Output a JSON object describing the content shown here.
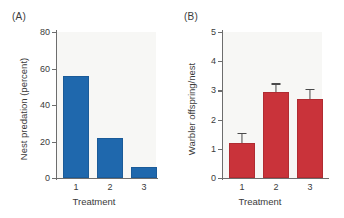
{
  "chart_data": [
    {
      "type": "bar",
      "panel": "(A)",
      "title": "",
      "categories": [
        "1",
        "2",
        "3"
      ],
      "values": [
        56,
        22,
        6
      ],
      "xlabel": "Treatment",
      "ylabel": "Nest predation (percent)",
      "ylim": [
        0,
        80
      ],
      "yticks": [
        0,
        20,
        40,
        60,
        80
      ],
      "ytick_labels": [
        "0",
        "20",
        "40",
        "60",
        "80"
      ],
      "bar_color": "#1f68ad",
      "grid": false,
      "legend": "none",
      "errors": [
        0,
        0,
        0
      ]
    },
    {
      "type": "bar",
      "panel": "(B)",
      "title": "",
      "categories": [
        "1",
        "2",
        "3"
      ],
      "values": [
        1.2,
        2.95,
        2.7
      ],
      "errors": [
        0.3,
        0.25,
        0.3
      ],
      "error_direction": "upper",
      "xlabel": "Treatment",
      "ylabel": "Warbler offspring/nest",
      "ylim": [
        0,
        5
      ],
      "yticks": [
        0,
        1,
        2,
        3,
        4,
        5
      ],
      "ytick_labels": [
        "0",
        "1",
        "2",
        "3",
        "4",
        "5"
      ],
      "bar_color": "#c9333a",
      "grid": false,
      "legend": "none"
    }
  ],
  "panel_a": {
    "label": "(A)",
    "ylabel": "Nest predation (percent)",
    "xlabel": "Treatment",
    "ytick_labels": [
      "80",
      "60",
      "40",
      "20",
      "0"
    ],
    "xtick_labels": [
      "1",
      "2",
      "3"
    ]
  },
  "panel_b": {
    "label": "(B)",
    "ylabel": "Warbler offspring/nest",
    "xlabel": "Treatment",
    "ytick_labels": [
      "5",
      "4",
      "3",
      "2",
      "1",
      "0"
    ],
    "xtick_labels": [
      "1",
      "2",
      "3"
    ]
  },
  "colors": {
    "blue": "#1f68ad",
    "red": "#c9333a",
    "axis": "#6d6d6d",
    "plot_bg": "#f7f7f5",
    "text": "#3b3b3b"
  }
}
